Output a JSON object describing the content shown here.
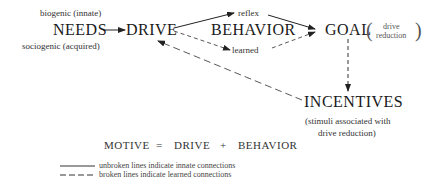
{
  "nodes": {
    "needs": {
      "label": "NEEDS",
      "above": "biogenic (innate)",
      "below": "sociogenic (acquired)"
    },
    "drive": {
      "label": "DRIVE"
    },
    "behavior": {
      "label": "BEHAVIOR",
      "reflex": "reflex",
      "learned": "learned"
    },
    "goal": {
      "label": "GOAL",
      "note_line1": "drive",
      "note_line2": "reduction",
      "paren_open": "(",
      "paren_close": ")"
    },
    "incentives": {
      "label": "INCENTIVES",
      "note_line1": "(stimuli associated with",
      "note_line2": "drive reduction)"
    }
  },
  "equation": {
    "lhs": "MOTIVE",
    "eq": "=",
    "term1": "DRIVE",
    "plus": "+",
    "term2": "BEHAVIOR"
  },
  "legend": {
    "solid": "unbroken lines indicate innate connections",
    "dashed": "broken lines indicate learned connections"
  },
  "edges": [
    {
      "from": "needs",
      "to": "drive",
      "style": "solid"
    },
    {
      "from": "drive",
      "to": "reflex",
      "style": "solid"
    },
    {
      "from": "reflex",
      "to": "goal",
      "style": "solid"
    },
    {
      "from": "drive",
      "to": "learned",
      "style": "dashed"
    },
    {
      "from": "learned",
      "to": "goal",
      "style": "dashed"
    },
    {
      "from": "goal",
      "to": "incentives",
      "style": "dashed"
    },
    {
      "from": "incentives",
      "to": "drive",
      "style": "dashed"
    }
  ]
}
